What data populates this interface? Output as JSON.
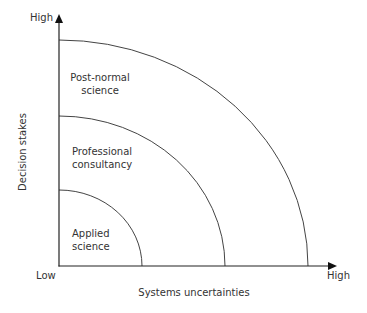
{
  "diagram": {
    "type": "quadrant-arcs",
    "y_axis": {
      "label": "Decision stakes",
      "high_label": "High"
    },
    "x_axis": {
      "label": "Systems uncertainties",
      "low_label": "Low",
      "high_label": "High"
    },
    "zones": [
      {
        "id": "applied",
        "line1": "Applied",
        "line2": "science"
      },
      {
        "id": "professional",
        "line1": "Professional",
        "line2": "consultancy"
      },
      {
        "id": "post-normal",
        "line1": "Post-normal",
        "line2": "science"
      }
    ],
    "colors": {
      "line": "#333333",
      "text": "#333333",
      "background": "#ffffff"
    }
  }
}
